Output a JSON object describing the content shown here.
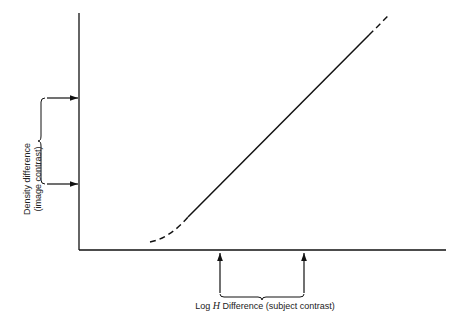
{
  "diagram": {
    "type": "characteristic-curve",
    "y_label_line1": "Density difference",
    "y_label_line2": "(image contrast)",
    "x_label_prefix": "Log ",
    "x_label_var": "H",
    "x_label_suffix": " Difference (subject contrast)",
    "colors": {
      "line": "#111111",
      "background": "#ffffff"
    }
  }
}
